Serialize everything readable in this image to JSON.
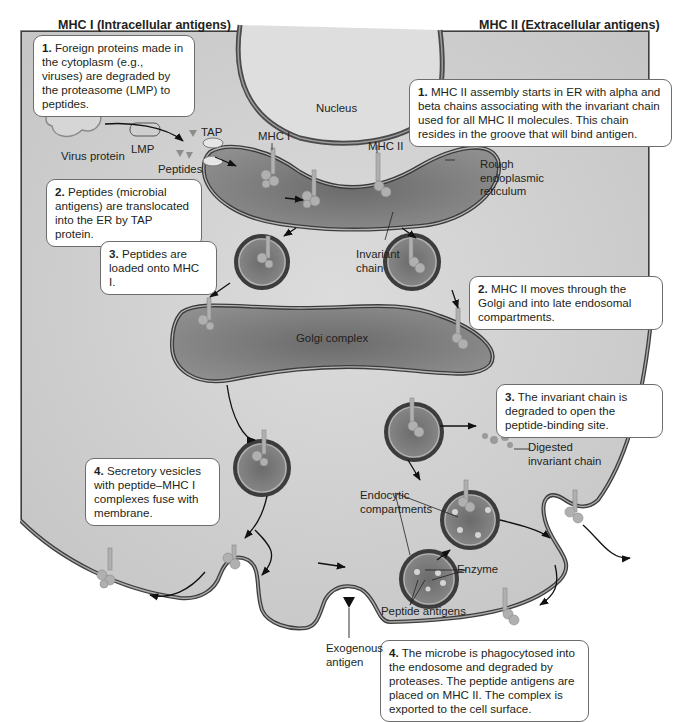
{
  "headers": {
    "mhc1": "MHC I (Intracellular antigens)",
    "mhc2": "MHC II (Extracellular antigens)"
  },
  "mhc1_steps": [
    {
      "num": "1.",
      "text": " Foreign proteins made in the cytoplasm (e.g., viruses) are degraded by the proteasome (LMP) to peptides."
    },
    {
      "num": "2.",
      "text": " Peptides (microbial antigens) are translocated into the ER by TAP protein."
    },
    {
      "num": "3.",
      "text": " Peptides are loaded onto MHC I."
    },
    {
      "num": "4.",
      "text": " Secretory vesicles with peptide–MHC I complexes fuse with membrane."
    }
  ],
  "mhc2_steps": [
    {
      "num": "1.",
      "text": " MHC II assembly starts in ER with alpha and beta chains associating with the invariant chain used for all MHC II molecules. This chain resides in the groove that will bind antigen."
    },
    {
      "num": "2.",
      "text": " MHC II moves through the Golgi and into late endosomal compartments."
    },
    {
      "num": "3.",
      "text": " The invariant chain is degraded to open the peptide-binding site."
    },
    {
      "num": "4.",
      "text": " The microbe is phagocytosed into the endosome and degraded by proteases. The peptide antigens are placed on MHC II. The complex is exported to the cell surface."
    }
  ],
  "labels": {
    "nucleus": "Nucleus",
    "virus_protein": "Virus protein",
    "lmp": "LMP",
    "tap": "TAP",
    "peptides": "Peptides",
    "mhc1": "MHC I",
    "mhc2": "MHC II",
    "rough_er": "Rough endoplasmic reticulum",
    "invariant_chain": "Invariant chain",
    "golgi": "Golgi complex",
    "digested_invariant_chain": "Digested invariant chain",
    "endocytic_compartments": "Endocytic compartments",
    "enzyme": "Enzyme",
    "peptide_antigens": "Peptide antigens",
    "exogenous_antigen": "Exogenous antigen"
  },
  "colors": {
    "cytoplasm": "#d2d2d2",
    "organelle": "#7a7a7a",
    "membrane": "#4a4a4a",
    "mhc": "#a9a9a9"
  }
}
